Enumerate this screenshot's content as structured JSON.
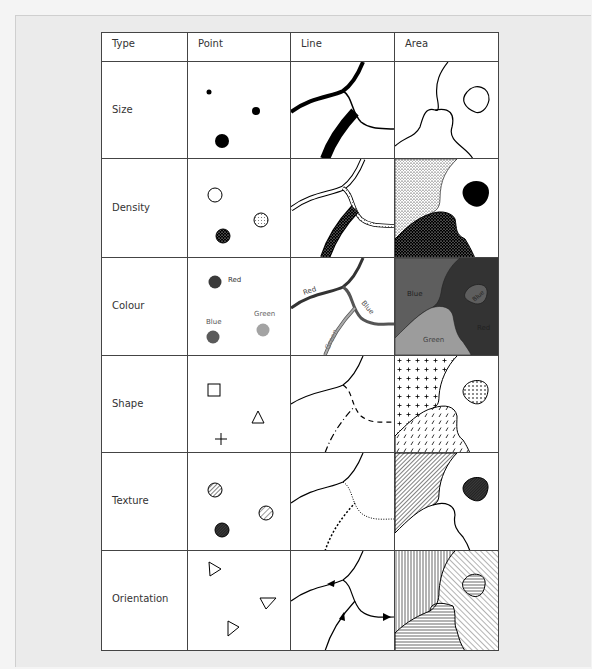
{
  "table": {
    "headers": [
      "Type",
      "Point",
      "Line",
      "Area"
    ],
    "rows": [
      {
        "type": "Size"
      },
      {
        "type": "Density"
      },
      {
        "type": "Colour"
      },
      {
        "type": "Shape"
      },
      {
        "type": "Texture"
      },
      {
        "type": "Orientation"
      }
    ]
  },
  "colour_labels": {
    "point": {
      "red": "Red",
      "blue": "Blue",
      "green": "Green"
    },
    "line": {
      "red": "Red",
      "blue": "Blue",
      "green": "Green"
    },
    "area": {
      "blue": "Blue",
      "blue_island": "Blue",
      "red": "Red",
      "green": "Green"
    }
  },
  "colors": {
    "red": "#3a3a3a",
    "blue": "#5a5a5a",
    "green": "#a3a3a3",
    "area_blue": "#5e5e5e",
    "area_red": "#333333",
    "area_green": "#9c9c9c",
    "grid": "#444444"
  }
}
